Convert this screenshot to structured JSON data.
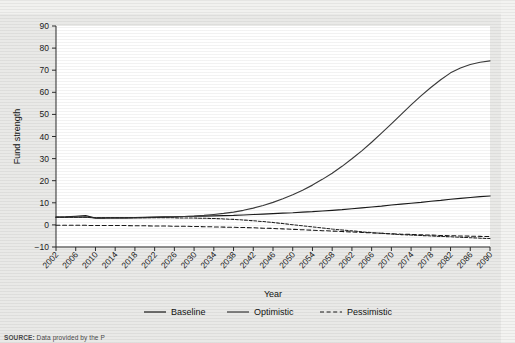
{
  "figure": {
    "source_note_prefix": "SOURCE:",
    "source_note": "Data provided by the P"
  },
  "chart_data": {
    "type": "line",
    "title": "",
    "xlabel": "Year",
    "ylabel": "Fund strength",
    "xlim": [
      2002,
      2090
    ],
    "ylim": [
      -10,
      90
    ],
    "ytick_values": [
      -10,
      0,
      10,
      20,
      30,
      40,
      50,
      60,
      70,
      80,
      90
    ],
    "ytick_labels": [
      "−10",
      "0",
      "10",
      "20",
      "30",
      "40",
      "50",
      "60",
      "70",
      "80",
      "90"
    ],
    "xtick_labels": [
      "2002",
      "2006",
      "2010",
      "2014",
      "2018",
      "2022",
      "2026",
      "2030",
      "2034",
      "2038",
      "2042",
      "2046",
      "2050",
      "2054",
      "2058",
      "2062",
      "2066",
      "2070",
      "2074",
      "2078",
      "2082",
      "2086",
      "2090"
    ],
    "grid": false,
    "legend_position": "bottom",
    "x": [
      2002,
      2004,
      2006,
      2008,
      2010,
      2012,
      2014,
      2016,
      2018,
      2020,
      2022,
      2024,
      2026,
      2028,
      2030,
      2032,
      2034,
      2036,
      2038,
      2040,
      2042,
      2044,
      2046,
      2048,
      2050,
      2052,
      2054,
      2056,
      2058,
      2060,
      2062,
      2064,
      2066,
      2068,
      2070,
      2072,
      2074,
      2076,
      2078,
      2080,
      2082,
      2084,
      2086,
      2088,
      2090
    ],
    "series": [
      {
        "name": "Baseline",
        "style": "solid",
        "color": "#1a1a1a",
        "values": [
          3.5,
          3.6,
          3.9,
          4.2,
          3.1,
          3.1,
          3.2,
          3.2,
          3.3,
          3.4,
          3.5,
          3.6,
          3.7,
          3.8,
          3.9,
          4.0,
          4.1,
          4.2,
          4.3,
          4.5,
          4.7,
          4.9,
          5.1,
          5.3,
          5.5,
          5.8,
          6.0,
          6.3,
          6.6,
          6.9,
          7.3,
          7.7,
          8.1,
          8.5,
          9.0,
          9.4,
          9.8,
          10.2,
          10.7,
          11.1,
          11.6,
          12.0,
          12.4,
          12.8,
          13.1
        ]
      },
      {
        "name": "Optimistic",
        "style": "solid",
        "color": "#3a3a3a",
        "values": [
          3.5,
          3.5,
          3.5,
          3.5,
          3.2,
          3.2,
          3.2,
          3.2,
          3.3,
          3.3,
          3.4,
          3.5,
          3.6,
          3.8,
          4.0,
          4.3,
          4.7,
          5.2,
          5.8,
          6.6,
          7.6,
          8.8,
          10.2,
          11.8,
          13.6,
          15.7,
          18.0,
          20.6,
          23.4,
          26.5,
          29.9,
          33.5,
          37.4,
          41.5,
          45.7,
          50.0,
          54.3,
          58.4,
          62.2,
          65.7,
          68.8,
          71.0,
          72.6,
          73.6,
          74.2
        ]
      },
      {
        "name": "Pessimistic",
        "style": "dashed",
        "color": "#1a1a1a",
        "values": [
          -0.2,
          -0.2,
          -0.2,
          -0.2,
          -0.3,
          -0.3,
          -0.3,
          -0.3,
          -0.4,
          -0.4,
          -0.5,
          -0.5,
          -0.6,
          -0.6,
          -0.7,
          -0.8,
          -0.9,
          -1.0,
          -1.1,
          -1.2,
          -1.3,
          -1.5,
          -1.6,
          -1.8,
          -2.0,
          -2.2,
          -2.4,
          -2.6,
          -2.8,
          -3.0,
          -3.2,
          -3.4,
          -3.6,
          -3.8,
          -4.0,
          -4.2,
          -4.3,
          -4.5,
          -4.6,
          -4.8,
          -4.9,
          -5.0,
          -5.1,
          -5.2,
          -5.3
        ]
      },
      {
        "name": "Transition",
        "style": "dashed-dense",
        "color": "#222222",
        "values": [
          3.5,
          3.5,
          3.5,
          3.5,
          3.2,
          3.2,
          3.2,
          3.2,
          3.2,
          3.2,
          3.2,
          3.2,
          3.2,
          3.1,
          3.1,
          3.0,
          2.9,
          2.7,
          2.5,
          2.2,
          1.9,
          1.5,
          1.1,
          0.6,
          0.1,
          -0.4,
          -0.9,
          -1.4,
          -1.9,
          -2.3,
          -2.7,
          -3.1,
          -3.5,
          -3.8,
          -4.1,
          -4.4,
          -4.6,
          -4.8,
          -5.0,
          -5.2,
          -5.4,
          -5.6,
          -5.8,
          -6.0,
          -6.2
        ]
      }
    ],
    "legend": [
      {
        "label": "Baseline",
        "style": "solid"
      },
      {
        "label": "Optimistic",
        "style": "solid"
      },
      {
        "label": "Pessimistic",
        "style": "dashed"
      }
    ]
  }
}
